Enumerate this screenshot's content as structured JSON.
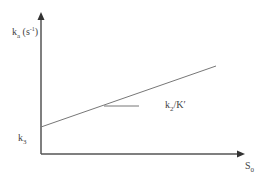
{
  "diagram": {
    "y_axis_label": "k",
    "y_axis_label_sub": "a",
    "y_axis_unit": " (s",
    "y_axis_unit_sup": "-1",
    "y_axis_unit_close": ")",
    "intercept_label": "k",
    "intercept_label_sub": "3",
    "slope_label": "k",
    "slope_label_sub": "2",
    "slope_label_rest": "/K′",
    "x_axis_label": "S",
    "x_axis_label_sub": "0",
    "colors": {
      "axis": "#555555",
      "line": "#777777"
    }
  }
}
